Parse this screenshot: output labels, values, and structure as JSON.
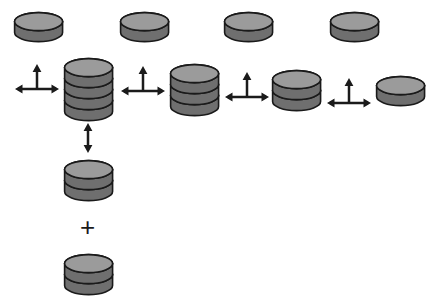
{
  "figure": {
    "background_color": "#ffffff",
    "palette": {
      "disc_top_face": "#9b9b9b",
      "disc_side": "#6f6f6f",
      "disc_outline": "#1a1a1a",
      "arrow_color": "#1b1b1b",
      "plus_color": "#1b1b1b"
    },
    "plus_label": "+",
    "disc_geometry": {
      "radius_x": 24,
      "radius_y": 9,
      "disc_height": 11,
      "outline_width": 1.6
    }
  },
  "top_row": {
    "label": "released monomer discs",
    "discs": [
      {
        "name": "monomer-1",
        "x": 12,
        "y": 10,
        "stack_count": 1
      },
      {
        "name": "monomer-2",
        "x": 118,
        "y": 10,
        "stack_count": 1
      },
      {
        "name": "monomer-3",
        "x": 222,
        "y": 10,
        "stack_count": 1
      },
      {
        "name": "monomer-4",
        "x": 328,
        "y": 10,
        "stack_count": 1
      }
    ]
  },
  "main_row": {
    "label": "stepwise dissociation series",
    "stacks": [
      {
        "name": "stack-tetramer",
        "x": 62,
        "y": 56,
        "stack_count": 4
      },
      {
        "name": "stack-trimer",
        "x": 168,
        "y": 62,
        "stack_count": 3
      },
      {
        "name": "stack-dimer",
        "x": 270,
        "y": 68,
        "stack_count": 2
      },
      {
        "name": "stack-monomer",
        "x": 374,
        "y": 74,
        "stack_count": 1
      }
    ],
    "arrows": [
      {
        "name": "equilibrium-arrow-1",
        "x": 14,
        "y": 62
      },
      {
        "name": "equilibrium-arrow-2",
        "x": 120,
        "y": 64
      },
      {
        "name": "equilibrium-arrow-3",
        "x": 224,
        "y": 70
      },
      {
        "name": "equilibrium-arrow-4",
        "x": 326,
        "y": 76
      }
    ]
  },
  "vertical_branch": {
    "label": "tetramer to two dimers pathway",
    "arrow": {
      "name": "vertical-equilibrium-arrow",
      "x": 80,
      "y": 122
    },
    "stacks": [
      {
        "name": "branch-dimer-upper",
        "x": 62,
        "y": 158,
        "stack_count": 2
      },
      {
        "name": "branch-dimer-lower",
        "x": 62,
        "y": 252,
        "stack_count": 2
      }
    ],
    "plus": {
      "name": "plus-operator",
      "x": 80,
      "y": 214
    }
  },
  "chart_data": {
    "type": "diagram",
    "nodes": [
      {
        "id": "tetramer",
        "stack_count": 4,
        "row": "main",
        "position": 1
      },
      {
        "id": "trimer",
        "stack_count": 3,
        "row": "main",
        "position": 2
      },
      {
        "id": "dimer",
        "stack_count": 2,
        "row": "main",
        "position": 3
      },
      {
        "id": "monomer",
        "stack_count": 1,
        "row": "main",
        "position": 4
      },
      {
        "id": "free-disc-1",
        "stack_count": 1,
        "row": "top",
        "position": 1
      },
      {
        "id": "free-disc-2",
        "stack_count": 1,
        "row": "top",
        "position": 2
      },
      {
        "id": "free-disc-3",
        "stack_count": 1,
        "row": "top",
        "position": 3
      },
      {
        "id": "free-disc-4",
        "stack_count": 1,
        "row": "top",
        "position": 4
      },
      {
        "id": "branch-dimer-a",
        "stack_count": 2,
        "row": "branch",
        "position": 1
      },
      {
        "id": "branch-dimer-b",
        "stack_count": 2,
        "row": "branch",
        "position": 2
      }
    ],
    "edges": [
      {
        "from": "tetramer",
        "to": "trimer",
        "type": "double-headed-horizontal",
        "releases": "free-disc-2"
      },
      {
        "from": "trimer",
        "to": "dimer",
        "type": "double-headed-horizontal",
        "releases": "free-disc-3"
      },
      {
        "from": "dimer",
        "to": "monomer",
        "type": "double-headed-horizontal",
        "releases": "free-disc-4"
      },
      {
        "from": "tetramer",
        "to": "free-disc-1",
        "type": "upward",
        "releases": "free-disc-1"
      },
      {
        "from": "tetramer",
        "to": "branch-dimer-a",
        "type": "double-headed-vertical",
        "releases": "branch-dimer-b"
      }
    ],
    "operators": [
      {
        "symbol": "+",
        "between": [
          "branch-dimer-a",
          "branch-dimer-b"
        ]
      }
    ]
  }
}
